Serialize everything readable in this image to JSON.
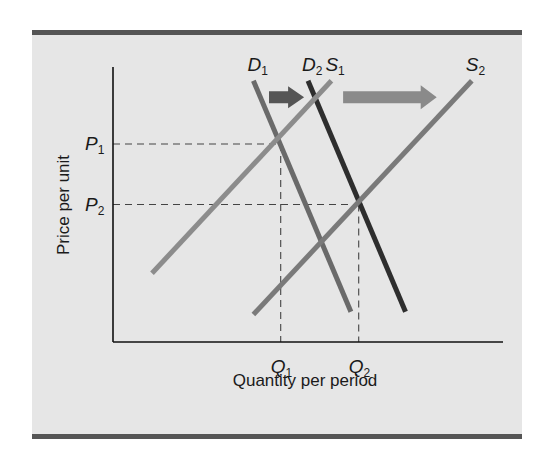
{
  "diagram": {
    "type": "supply-demand-shift",
    "title": "",
    "xlabel": "Quantity per period",
    "ylabel": "Price per unit",
    "colors": {
      "panel_bg": "#e6e6e6",
      "border": "#555555",
      "axis": "#111111",
      "demand_1": "#6a6a6a",
      "demand_2": "#2e2e2e",
      "supply_1": "#8c8c8c",
      "supply_2": "#7a7a7a",
      "arrow_small": "#555555",
      "arrow_large": "#8a8a8a",
      "guide": "#444444"
    },
    "curves": [
      {
        "id": "D1",
        "kind": "demand",
        "label": "D",
        "sub": "1",
        "from": [
          0.36,
          0.95
        ],
        "to": [
          0.61,
          0.11
        ]
      },
      {
        "id": "D2",
        "kind": "demand",
        "label": "D",
        "sub": "2",
        "from": [
          0.5,
          0.95
        ],
        "to": [
          0.75,
          0.11
        ]
      },
      {
        "id": "S1",
        "kind": "supply",
        "label": "S",
        "sub": "1",
        "from": [
          0.1,
          0.25
        ],
        "to": [
          0.56,
          0.95
        ]
      },
      {
        "id": "S2",
        "kind": "supply",
        "label": "S",
        "sub": "2",
        "from": [
          0.36,
          0.1
        ],
        "to": [
          0.92,
          0.95
        ]
      }
    ],
    "shift_arrows": [
      {
        "id": "demand-shift",
        "from": [
          0.4,
          0.89
        ],
        "to": [
          0.49,
          0.89
        ],
        "size": "small"
      },
      {
        "id": "supply-shift",
        "from": [
          0.59,
          0.89
        ],
        "to": [
          0.83,
          0.89
        ],
        "size": "large"
      }
    ],
    "equilibria": [
      {
        "id": "E1",
        "price_label": "P",
        "price_sub": "1",
        "qty_label": "Q",
        "qty_sub": "1",
        "q": 0.43,
        "p": 0.72
      },
      {
        "id": "E2",
        "price_label": "P",
        "price_sub": "2",
        "qty_label": "Q",
        "qty_sub": "2",
        "q": 0.63,
        "p": 0.5
      }
    ]
  }
}
